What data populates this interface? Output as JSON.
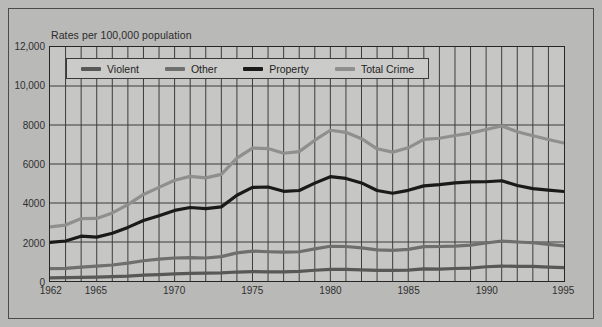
{
  "figure": {
    "title": "Rates per 100,000 population",
    "background_color": "#b9b9b7",
    "plot_background_color": "#c6c6c4",
    "frame_color": "#4b4b4b"
  },
  "chart_data": {
    "type": "line",
    "title": "Rates per 100,000 population",
    "xlabel": "",
    "ylabel": "Rates per 100,000 population",
    "xlim": [
      1962,
      1995
    ],
    "ylim": [
      0,
      12000
    ],
    "grid": true,
    "grid_x": "every year",
    "grid_y": "every 2000",
    "legend_position": "top-left inside plot",
    "x_ticks": [
      "1962",
      "1965",
      "1970",
      "1975",
      "1980",
      "1985",
      "1990",
      "1995"
    ],
    "x_tick_values": [
      1962,
      1965,
      1970,
      1975,
      1980,
      1985,
      1990,
      1995
    ],
    "y_ticks": [
      "0",
      "2000",
      "4000",
      "6000",
      "8000",
      "10,000",
      "12,000"
    ],
    "y_tick_values": [
      0,
      2000,
      4000,
      6000,
      8000,
      10000,
      12000
    ],
    "x": [
      1962,
      1963,
      1964,
      1965,
      1966,
      1967,
      1968,
      1969,
      1970,
      1971,
      1972,
      1973,
      1974,
      1975,
      1976,
      1977,
      1978,
      1979,
      1980,
      1981,
      1982,
      1983,
      1984,
      1985,
      1986,
      1987,
      1988,
      1989,
      1990,
      1991,
      1992,
      1993,
      1994,
      1995
    ],
    "series": [
      {
        "name": "Violent",
        "color": "#585858",
        "values": [
          160,
          170,
          190,
          200,
          220,
          250,
          300,
          330,
          365,
          395,
          400,
          415,
          460,
          485,
          470,
          470,
          495,
          550,
          600,
          595,
          570,
          540,
          540,
          560,
          620,
          610,
          640,
          665,
          730,
          760,
          755,
          750,
          715,
          685
        ]
      },
      {
        "name": "Other",
        "color": "#6f6f6f",
        "values": [
          630,
          650,
          710,
          760,
          820,
          920,
          1040,
          1120,
          1180,
          1200,
          1180,
          1250,
          1440,
          1530,
          1500,
          1480,
          1500,
          1650,
          1780,
          1770,
          1700,
          1600,
          1570,
          1620,
          1760,
          1770,
          1790,
          1840,
          1950,
          2050,
          2000,
          1960,
          1880,
          1800
        ]
      },
      {
        "name": "Property",
        "color": "#1a1a1a",
        "values": [
          1980,
          2050,
          2300,
          2250,
          2450,
          2750,
          3100,
          3350,
          3620,
          3770,
          3710,
          3800,
          4400,
          4800,
          4820,
          4600,
          4640,
          5020,
          5350,
          5260,
          5030,
          4640,
          4500,
          4650,
          4880,
          4940,
          5030,
          5080,
          5090,
          5140,
          4900,
          4740,
          4660,
          4590
        ]
      },
      {
        "name": "Total Crime",
        "color": "#8f8f8f",
        "values": [
          2770,
          2870,
          3200,
          3210,
          3490,
          3920,
          4440,
          4800,
          5165,
          5365,
          5290,
          5465,
          6300,
          6815,
          6790,
          6550,
          6635,
          7220,
          7730,
          7625,
          7300,
          6780,
          6610,
          6830,
          7260,
          7320,
          7460,
          7585,
          7770,
          7950,
          7655,
          7450,
          7255,
          7075
        ]
      }
    ],
    "annotations": [
      {
        "text": "Total Crime peaks near 1991 at about 10,300"
      },
      {
        "text": "Property peaks near 1991 at about 6,100"
      },
      {
        "text": "All series rise steeply from 1962 to about 1980"
      }
    ]
  },
  "legend": {
    "items": [
      {
        "label": "Violent",
        "color": "#585858"
      },
      {
        "label": "Other",
        "color": "#6f6f6f"
      },
      {
        "label": "Property",
        "color": "#1a1a1a"
      },
      {
        "label": "Total Crime",
        "color": "#8f8f8f"
      }
    ]
  }
}
